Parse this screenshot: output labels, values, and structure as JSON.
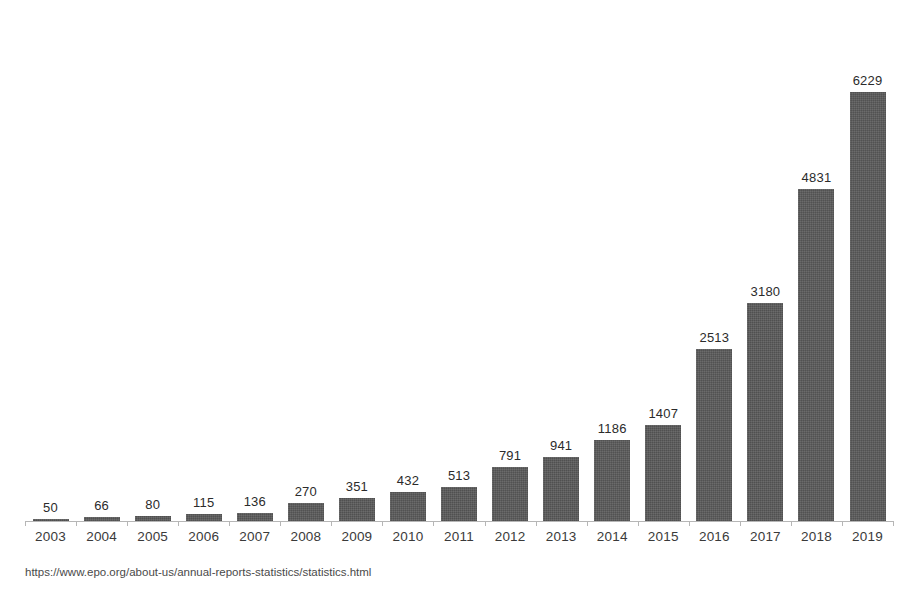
{
  "chart_data": {
    "type": "bar",
    "title": "",
    "xlabel": "",
    "ylabel": "",
    "ylim": [
      0,
      6700
    ],
    "grid": false,
    "legend": null,
    "categories": [
      "2003",
      "2004",
      "2005",
      "2006",
      "2007",
      "2008",
      "2009",
      "2010",
      "2011",
      "2012",
      "2013",
      "2014",
      "2015",
      "2016",
      "2017",
      "2018",
      "2019"
    ],
    "values": [
      50,
      66,
      80,
      115,
      136,
      270,
      351,
      432,
      513,
      791,
      941,
      1186,
      1407,
      2513,
      3180,
      4831,
      6229
    ],
    "data_labels": [
      "50",
      "66",
      "80",
      "115",
      "136",
      "270",
      "351",
      "432",
      "513",
      "791",
      "941",
      "1186",
      "1407",
      "2513",
      "3180",
      "4831",
      "6229"
    ],
    "bar_color": "#5a5a5a",
    "label_color": "#2b2b2b",
    "axis_color": "#b6b6b6",
    "series": [
      {
        "name": "",
        "values": [
          50,
          66,
          80,
          115,
          136,
          270,
          351,
          432,
          513,
          791,
          941,
          1186,
          1407,
          2513,
          3180,
          4831,
          6229
        ]
      }
    ]
  },
  "figure": {
    "title_clipped": "",
    "caption": "https://www.epo.org/about-us/annual-reports-statistics/statistics.html"
  }
}
